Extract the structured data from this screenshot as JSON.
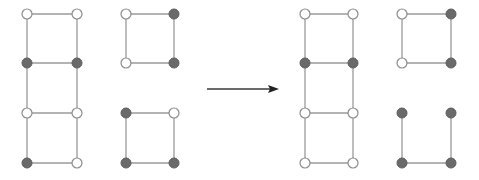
{
  "diagram": {
    "colors": {
      "edge": "#9a9a9a",
      "filled_node": "#6a6a6a",
      "hollow_node": "#ffffff",
      "arrow": "#222222"
    },
    "node_radius": 5,
    "arrow": {
      "x1": 207,
      "y1": 89,
      "x2": 279,
      "y2": 89,
      "direction": "right"
    },
    "panels": [
      {
        "name": "before",
        "components": [
          {
            "name": "ladder",
            "nodes": [
              {
                "id": "a1",
                "x": 27,
                "y": 14,
                "state": "hollow"
              },
              {
                "id": "a2",
                "x": 77,
                "y": 14,
                "state": "hollow"
              },
              {
                "id": "a3",
                "x": 27,
                "y": 63,
                "state": "filled"
              },
              {
                "id": "a4",
                "x": 77,
                "y": 63,
                "state": "filled"
              },
              {
                "id": "a5",
                "x": 27,
                "y": 113,
                "state": "hollow"
              },
              {
                "id": "a6",
                "x": 77,
                "y": 113,
                "state": "hollow"
              },
              {
                "id": "a7",
                "x": 27,
                "y": 163,
                "state": "filled"
              },
              {
                "id": "a8",
                "x": 77,
                "y": 163,
                "state": "hollow"
              }
            ],
            "edges": [
              [
                "a1",
                "a2"
              ],
              [
                "a1",
                "a3"
              ],
              [
                "a2",
                "a4"
              ],
              [
                "a3",
                "a4"
              ],
              [
                "a3",
                "a5"
              ],
              [
                "a4",
                "a6"
              ],
              [
                "a5",
                "a6"
              ],
              [
                "a5",
                "a7"
              ],
              [
                "a6",
                "a8"
              ],
              [
                "a7",
                "a8"
              ]
            ]
          },
          {
            "name": "square-top",
            "nodes": [
              {
                "id": "b1",
                "x": 126,
                "y": 14,
                "state": "hollow"
              },
              {
                "id": "b2",
                "x": 174,
                "y": 14,
                "state": "filled"
              },
              {
                "id": "b3",
                "x": 126,
                "y": 63,
                "state": "hollow"
              },
              {
                "id": "b4",
                "x": 174,
                "y": 63,
                "state": "filled"
              }
            ],
            "edges": [
              [
                "b1",
                "b2"
              ],
              [
                "b1",
                "b3"
              ],
              [
                "b2",
                "b4"
              ],
              [
                "b3",
                "b4"
              ]
            ]
          },
          {
            "name": "square-bottom",
            "nodes": [
              {
                "id": "c1",
                "x": 126,
                "y": 113,
                "state": "filled"
              },
              {
                "id": "c2",
                "x": 174,
                "y": 113,
                "state": "hollow"
              },
              {
                "id": "c3",
                "x": 126,
                "y": 163,
                "state": "filled"
              },
              {
                "id": "c4",
                "x": 174,
                "y": 163,
                "state": "filled"
              }
            ],
            "edges": [
              [
                "c1",
                "c2"
              ],
              [
                "c1",
                "c3"
              ],
              [
                "c2",
                "c4"
              ],
              [
                "c3",
                "c4"
              ]
            ]
          }
        ]
      },
      {
        "name": "after",
        "components": [
          {
            "name": "ladder",
            "nodes": [
              {
                "id": "d1",
                "x": 305,
                "y": 14,
                "state": "hollow"
              },
              {
                "id": "d2",
                "x": 353,
                "y": 14,
                "state": "hollow"
              },
              {
                "id": "d3",
                "x": 305,
                "y": 63,
                "state": "filled"
              },
              {
                "id": "d4",
                "x": 353,
                "y": 63,
                "state": "filled"
              },
              {
                "id": "d5",
                "x": 305,
                "y": 113,
                "state": "hollow"
              },
              {
                "id": "d6",
                "x": 353,
                "y": 113,
                "state": "hollow"
              },
              {
                "id": "d7",
                "x": 305,
                "y": 163,
                "state": "hollow"
              },
              {
                "id": "d8",
                "x": 353,
                "y": 163,
                "state": "hollow"
              }
            ],
            "edges": [
              [
                "d1",
                "d2"
              ],
              [
                "d1",
                "d3"
              ],
              [
                "d2",
                "d4"
              ],
              [
                "d3",
                "d4"
              ],
              [
                "d3",
                "d5"
              ],
              [
                "d4",
                "d6"
              ],
              [
                "d5",
                "d6"
              ],
              [
                "d5",
                "d7"
              ],
              [
                "d6",
                "d8"
              ],
              [
                "d7",
                "d8"
              ]
            ]
          },
          {
            "name": "square-top",
            "nodes": [
              {
                "id": "e1",
                "x": 402,
                "y": 14,
                "state": "hollow"
              },
              {
                "id": "e2",
                "x": 451,
                "y": 14,
                "state": "filled"
              },
              {
                "id": "e3",
                "x": 402,
                "y": 63,
                "state": "hollow"
              },
              {
                "id": "e4",
                "x": 451,
                "y": 63,
                "state": "filled"
              }
            ],
            "edges": [
              [
                "e1",
                "e2"
              ],
              [
                "e1",
                "e3"
              ],
              [
                "e2",
                "e4"
              ],
              [
                "e3",
                "e4"
              ]
            ]
          },
          {
            "name": "square-bottom",
            "nodes": [
              {
                "id": "f1",
                "x": 402,
                "y": 113,
                "state": "filled"
              },
              {
                "id": "f2",
                "x": 451,
                "y": 113,
                "state": "filled"
              },
              {
                "id": "f3",
                "x": 402,
                "y": 163,
                "state": "filled"
              },
              {
                "id": "f4",
                "x": 451,
                "y": 163,
                "state": "filled"
              }
            ],
            "edges": [
              [
                "f1",
                "f2",
                "gradient"
              ],
              [
                "f1",
                "f3"
              ],
              [
                "f2",
                "f4"
              ],
              [
                "f3",
                "f4"
              ]
            ]
          }
        ]
      }
    ]
  }
}
